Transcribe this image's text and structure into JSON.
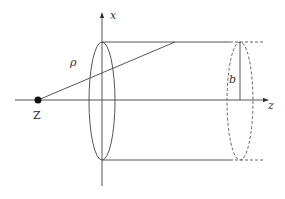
{
  "diagram": {
    "type": "cylinder-geometry",
    "labels": {
      "x_axis": "x",
      "z_axis": "z",
      "point": "Z",
      "rho": "ρ",
      "radius": "b"
    },
    "colors": {
      "stroke": "#444444",
      "background": "#ffffff"
    }
  }
}
